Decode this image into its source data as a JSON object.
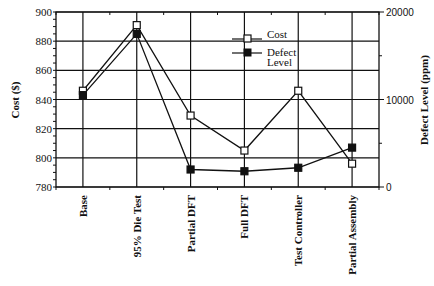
{
  "chart_data": {
    "type": "line",
    "title": "",
    "categories": [
      "Base",
      "95% Die Test",
      "Partial DFT",
      "Full DFT",
      "Test Controller",
      "Partial Assembly"
    ],
    "series": [
      {
        "name": "Cost",
        "axis": "left",
        "marker": "open-square",
        "values": [
          846,
          891,
          829,
          805,
          846,
          796
        ]
      },
      {
        "name": "Defect Level",
        "axis": "right",
        "marker": "filled-square",
        "values": [
          10500,
          17500,
          2000,
          1800,
          2200,
          4500
        ]
      }
    ],
    "xlabel": "",
    "ylabel": "Cost  ($)",
    "ylabel_right": "Defect  Level  (ppm)",
    "ylim": [
      780,
      900
    ],
    "ylim_right": [
      0,
      20000
    ],
    "yticks": [
      780,
      800,
      820,
      840,
      860,
      880,
      900
    ],
    "yticks_right": [
      0,
      10000,
      20000
    ],
    "grid": true,
    "legend_position": "upper-right-inside"
  },
  "legend": {
    "cost_label": "Cost",
    "defect_label_line1": "Defect",
    "defect_label_line2": "Level"
  },
  "axes": {
    "left_title": "Cost  ($)",
    "right_title": "Defect  Level  (ppm)"
  }
}
